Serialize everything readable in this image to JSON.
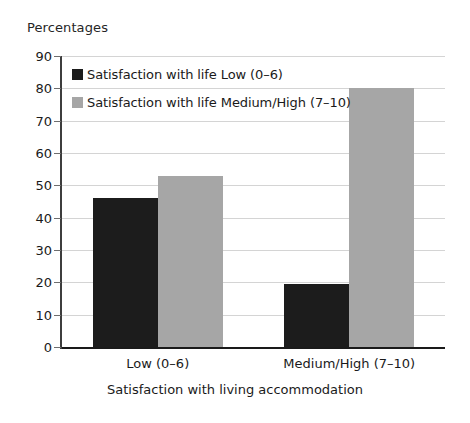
{
  "chart_data": {
    "type": "bar",
    "title": "",
    "ylabel": "Percentages",
    "xlabel": "Satisfaction with living accommodation",
    "categories": [
      "Low (0–6)",
      "Medium/High (7–10)"
    ],
    "series": [
      {
        "name": "Satisfaction with life Low (0–6)",
        "values": [
          46,
          19.5
        ],
        "color": "#1c1c1c"
      },
      {
        "name": "Satisfaction with life Medium/High  (7–10)",
        "values": [
          53,
          80
        ],
        "color": "#a6a6a6"
      }
    ],
    "ylim": [
      0,
      90
    ],
    "ytick_step": 10,
    "yticks": [
      "90",
      "80",
      "70",
      "60",
      "50",
      "40",
      "30",
      "20",
      "10",
      "0"
    ],
    "grid": true,
    "legend_position": "upper-left-inside"
  },
  "legend": {
    "items": [
      {
        "label": "Satisfaction with life Low (0–6)",
        "swatch": "dark"
      },
      {
        "label": "Satisfaction with life Medium/High  (7–10)",
        "swatch": "light"
      }
    ]
  },
  "axes": {
    "y_caption": "Percentages",
    "x_caption": "Satisfaction with living accommodation"
  },
  "colors": {
    "series_dark": "#1c1c1c",
    "series_light": "#a6a6a6",
    "gridline": "#d4d4d4",
    "axis": "#3d3d3d"
  }
}
